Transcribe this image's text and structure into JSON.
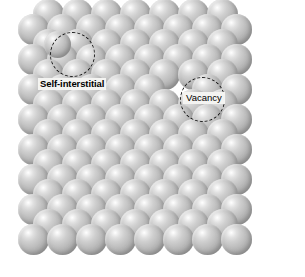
{
  "figure": {
    "name": "crystal-lattice-point-defects",
    "background_color": "#ffffff",
    "width": 305,
    "height": 277
  },
  "atom": {
    "diameter": 31,
    "fill_highlight_color": "#ffffff",
    "fill_mid_color": "#bdbdbd",
    "fill_shadow_color": "#949494",
    "semantic_name": "atom-sphere"
  },
  "lattice": {
    "description": "close-packed two-dimensional array of identical atoms in offset rows",
    "row_pitch": 15.2,
    "column_pitch": 29.0,
    "row_count": 16,
    "rows": [
      {
        "y": 14,
        "x_start": 48,
        "count": 7,
        "offset": true
      },
      {
        "y": 29,
        "x_start": 33,
        "count": 8,
        "offset": false
      },
      {
        "y": 44,
        "x_start": 48,
        "count": 7,
        "offset": true
      },
      {
        "y": 59,
        "x_start": 33,
        "count": 8,
        "offset": false
      },
      {
        "y": 74,
        "x_start": 48,
        "count": 7,
        "offset": true
      },
      {
        "y": 89,
        "x_start": 33,
        "count": 8,
        "offset": false
      },
      {
        "y": 104,
        "x_start": 48,
        "count": 7,
        "offset": true
      },
      {
        "y": 119,
        "x_start": 33,
        "count": 8,
        "offset": false
      },
      {
        "y": 134,
        "x_start": 48,
        "count": 7,
        "offset": true
      },
      {
        "y": 149,
        "x_start": 33,
        "count": 8,
        "offset": false
      },
      {
        "y": 164,
        "x_start": 48,
        "count": 7,
        "offset": true
      },
      {
        "y": 179,
        "x_start": 33,
        "count": 8,
        "offset": false
      },
      {
        "y": 194,
        "x_start": 48,
        "count": 7,
        "offset": true
      },
      {
        "y": 209,
        "x_start": 33,
        "count": 8,
        "offset": false
      },
      {
        "y": 224,
        "x_start": 48,
        "count": 7,
        "offset": true
      },
      {
        "y": 239,
        "x_start": 33,
        "count": 8,
        "offset": false
      }
    ],
    "extra_atoms": [
      {
        "x": 57,
        "y": 44,
        "defect": "self-interstitial"
      }
    ],
    "missing_atoms": [
      {
        "row": 5,
        "index": 5,
        "defect": "vacancy"
      }
    ]
  },
  "annotations": [
    {
      "id": "self-interstitial",
      "label": "Self-interstitial",
      "circle": {
        "x": 50,
        "y": 32,
        "size": 45
      },
      "label_position": {
        "x": 38,
        "y": 78
      },
      "stroke_color": "#171717",
      "label_color": "#000000"
    },
    {
      "id": "vacancy",
      "label": "Vacancy",
      "circle": {
        "x": 180,
        "y": 77,
        "size": 45
      },
      "label_position": {
        "x": 183,
        "y": 92
      },
      "stroke_color": "#171717",
      "label_color": "#000000"
    }
  ]
}
